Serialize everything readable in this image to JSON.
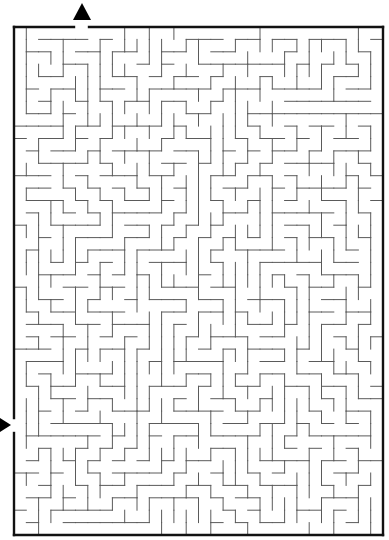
{
  "maze": {
    "title": "Rectangular maze puzzle",
    "grid": {
      "cols": 30,
      "rows": 41,
      "cell": 12.3,
      "origin_x": 14,
      "origin_y": 27
    },
    "border": {
      "left": 14,
      "top": 27,
      "right": 383,
      "bottom": 535,
      "color": "#111111"
    },
    "wall_color": "#5a5a5a",
    "entrances": [
      {
        "name": "top-exit",
        "side": "top",
        "from": 74,
        "to": 89
      },
      {
        "name": "left-entrance",
        "side": "left",
        "from": 418,
        "to": 433
      }
    ],
    "arrows": [
      {
        "name": "top-exit-arrow",
        "direction": "up",
        "points": "73,20 91,20 82,3"
      },
      {
        "name": "left-entrance-arrow",
        "direction": "right",
        "points": "0,418 0,432 11,425"
      }
    ],
    "seed": 7331
  }
}
